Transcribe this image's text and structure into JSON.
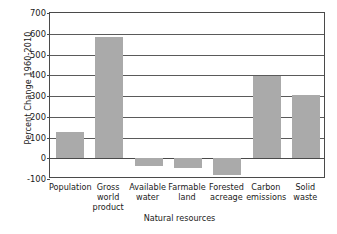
{
  "chart_data": {
    "type": "bar",
    "title": "",
    "subtitle": "",
    "xlabel": "",
    "ylabel": "Percent Change 1960-2010",
    "ylim": [
      -100,
      700
    ],
    "ytick_values": [
      700,
      600,
      500,
      400,
      300,
      200,
      100,
      0,
      -100
    ],
    "ytick_labels": [
      "700",
      "600",
      "500",
      "400",
      "300",
      "200",
      "100",
      "0",
      "-100"
    ],
    "grid": true,
    "legend": "none",
    "bar_color": "#aaaaaa",
    "categories": [
      "Population",
      "Gross world product",
      "Available water",
      "Farmable land",
      "Forested acreage",
      "Carbon emissions",
      "Solid waste"
    ],
    "category_label_lines": [
      [
        "Population"
      ],
      [
        "Gross",
        "world",
        "product"
      ],
      [
        "Available",
        "water"
      ],
      [
        "Farmable",
        "land"
      ],
      [
        "Forested",
        "acreage"
      ],
      [
        "Carbon",
        "emissions"
      ],
      [
        "Solid",
        "waste"
      ]
    ],
    "values": [
      127,
      583,
      -35,
      -45,
      -80,
      397,
      307
    ],
    "annotations": [
      {
        "text": "Natural resources",
        "type": "group-bracket",
        "spans": [
          "Available water",
          "Farmable land",
          "Forested acreage"
        ]
      }
    ]
  },
  "axis": {
    "y_title": "Percent Change 1960-2010"
  },
  "group": {
    "label": "Natural resources"
  }
}
